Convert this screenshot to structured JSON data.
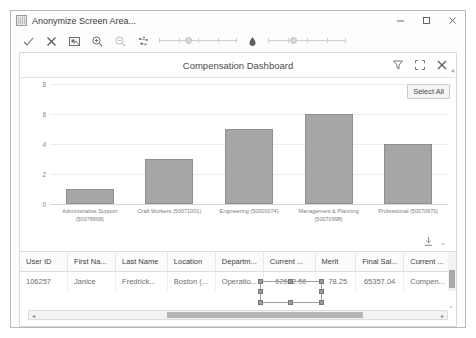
{
  "window": {
    "app_title": "Anonymize Screen Area...",
    "app_icon": "image-icon",
    "minimize_label": "–",
    "maximize_label": "□",
    "close_label": "✕"
  },
  "anonymize_toolbar": {
    "tools": [
      {
        "name": "confirm-check-icon",
        "glyph": "✓"
      },
      {
        "name": "cancel-x-icon",
        "glyph": "✕"
      },
      {
        "name": "select-area-icon",
        "glyph": "⧉"
      },
      {
        "name": "zoom-in-icon",
        "glyph": "⌕"
      },
      {
        "name": "zoom-out-icon",
        "glyph": "⌕"
      },
      {
        "name": "blur-scatter-icon",
        "glyph": "⁂"
      },
      {
        "name": "droplet-icon",
        "glyph": "⬤"
      }
    ],
    "slider_one": {
      "name": "blur-strength-slider",
      "value": 35
    },
    "slider_two": {
      "name": "opacity-slider",
      "value": 30
    }
  },
  "dashboard": {
    "title": "Compensation Dashboard",
    "actions": [
      {
        "name": "filter-funnel-icon",
        "label": "Filter"
      },
      {
        "name": "expand-fullscreen-icon",
        "label": "Expand"
      },
      {
        "name": "close-icon",
        "label": "Close"
      }
    ],
    "collapse_caret": "ⱏ",
    "select_all_label": "Select All",
    "export_icon_label": "Export",
    "export_caret": "⌄"
  },
  "chart_data": {
    "type": "bar",
    "title": "Compensation Dashboard",
    "xlabel": "",
    "ylabel": "",
    "ylim": [
      0,
      8
    ],
    "yticks": [
      0,
      2,
      4,
      6,
      8
    ],
    "grid": true,
    "legend": "none",
    "categories": [
      "Administrative Support (50078968)",
      "Craft Workers (50071001)",
      "Engineering (50000074)",
      "Management & Planning (50070998)",
      "Professional (50070970)"
    ],
    "values": [
      1,
      3,
      5,
      6,
      4
    ],
    "bar_color": "#a6a6a6"
  },
  "table": {
    "columns": [
      {
        "label": "User ID",
        "align": "left"
      },
      {
        "label": "First Na...",
        "align": "left"
      },
      {
        "label": "Last Name",
        "align": "left"
      },
      {
        "label": "Location",
        "align": "left"
      },
      {
        "label": "Departm...",
        "align": "left"
      },
      {
        "label": "Current ...",
        "align": "right"
      },
      {
        "label": "Merit",
        "align": "right"
      },
      {
        "label": "Final Sal...",
        "align": "right"
      },
      {
        "label": "Current ...",
        "align": "left"
      }
    ],
    "rows": [
      {
        "user_id": "106257",
        "first_name": "Janice",
        "last_name": "Fredrick...",
        "location": "Boston (...",
        "department": "Operatio...",
        "current_salary": "62602.56",
        "merit": "78.25",
        "final_salary": "65357.04",
        "current_title": "Compen..."
      }
    ]
  },
  "scrollbars": {
    "h_left_arrow": "◂",
    "h_right_arrow": "▸",
    "v_caret": "⌄"
  }
}
